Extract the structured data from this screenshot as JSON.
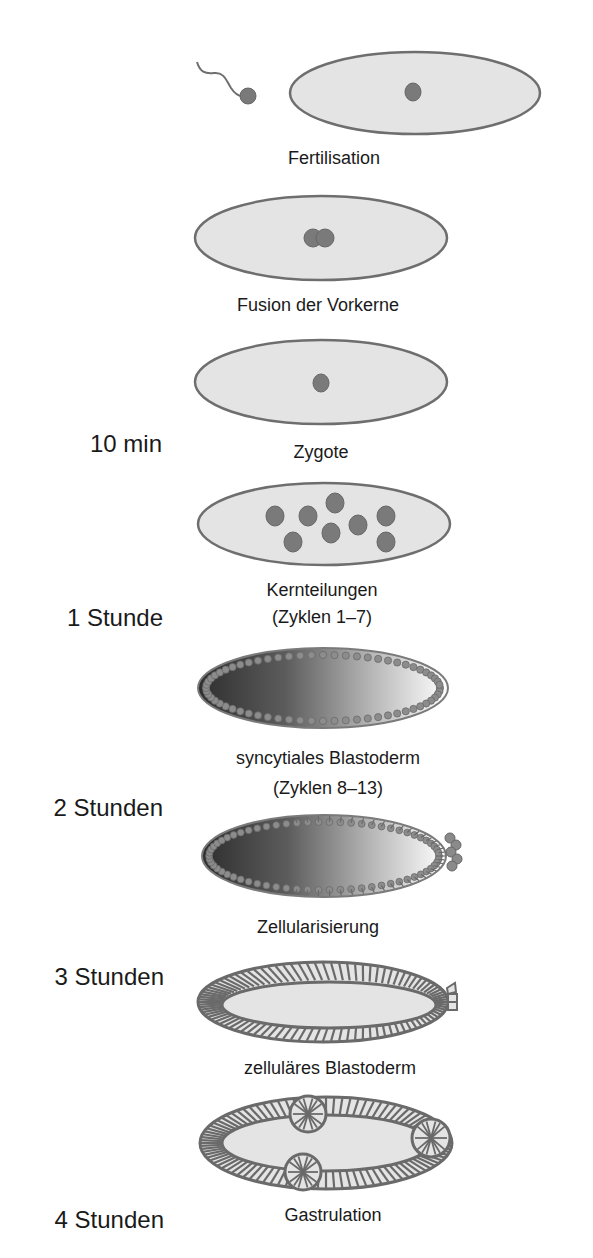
{
  "colors": {
    "egg_fill": "#e4e4e4",
    "egg_outline": "#6e6e6e",
    "nucleus": "#7a7a7a",
    "gradient_dark": "#333333",
    "gradient_light": "#ffffff",
    "cell_outline": "#6a6a6a",
    "text": "#1a1a1a"
  },
  "stages": [
    {
      "id": "fertilisation",
      "label": "Fertilisation",
      "label_line2": ""
    },
    {
      "id": "fusion",
      "label": "Fusion der Vorkerne",
      "label_line2": ""
    },
    {
      "id": "zygote",
      "label": "Zygote",
      "label_line2": ""
    },
    {
      "id": "nuclear-divisions",
      "label": "Kernteilungen",
      "label_line2": "(Zyklen 1–7)"
    },
    {
      "id": "syncytial-blastoderm",
      "label": "syncytiales Blastoderm",
      "label_line2": "(Zyklen 8–13)"
    },
    {
      "id": "cellularization",
      "label": "Zellularisierung",
      "label_line2": ""
    },
    {
      "id": "cellular-blastoderm",
      "label": "zelluläres Blastoderm",
      "label_line2": ""
    },
    {
      "id": "gastrulation",
      "label": "Gastrulation",
      "label_line2": ""
    }
  ],
  "time_markers": [
    {
      "label": "10 min"
    },
    {
      "label": "1 Stunde"
    },
    {
      "label": "2 Stunden"
    },
    {
      "label": "3 Stunden"
    },
    {
      "label": "4 Stunden"
    }
  ]
}
